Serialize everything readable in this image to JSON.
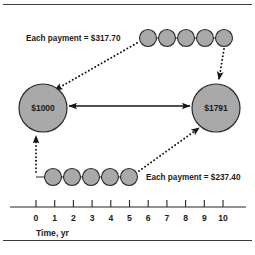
{
  "figure": {
    "title_hidden": "",
    "nodes": [
      {
        "id": "present-value",
        "label": "$1000",
        "cx": 43,
        "cy": 108,
        "r": 24
      },
      {
        "id": "future-value",
        "label": "$1791",
        "cx": 216,
        "cy": 108,
        "r": 24
      }
    ],
    "annotations": {
      "top_payment_label": "Each payment = $317.70",
      "bottom_payment_label": "Each payment = $237.40"
    },
    "axis": {
      "title": "Time, yr",
      "ticks": [
        "0",
        "1",
        "2",
        "3",
        "4",
        "5",
        "6",
        "7",
        "8",
        "9",
        "10"
      ],
      "min": 0,
      "max": 10,
      "x_start": 35,
      "x_end": 222,
      "y": 207
    },
    "payment_series": [
      {
        "id": "top-series",
        "label": "Each payment = $317.70",
        "amount": "$317.70",
        "years": [
          6,
          7,
          8,
          9,
          10
        ],
        "row_y": 38,
        "radius": 8.5
      },
      {
        "id": "bottom-series",
        "label": "Each payment = $237.40",
        "amount": "$237.40",
        "years": [
          1,
          2,
          3,
          4,
          5
        ],
        "row_y": 177,
        "radius": 8.5
      }
    ],
    "colors": {
      "circle_fill": "#a9a9a9",
      "stroke": "#2a2a2a",
      "arrow": "#141414",
      "text": "#1b1b1b",
      "background": "#ffffff",
      "rule": "#3b3b42"
    }
  }
}
